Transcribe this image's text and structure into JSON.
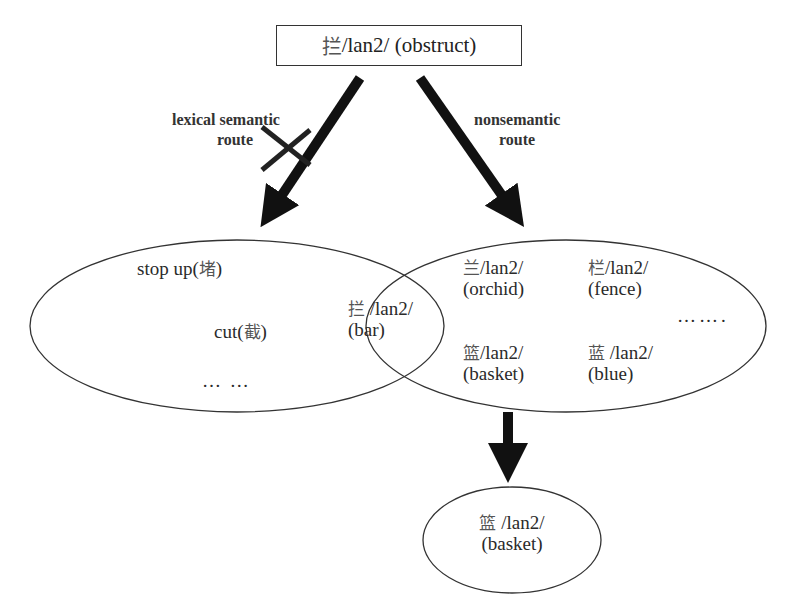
{
  "top_node": {
    "char": "拦",
    "pinyin": "/lan2/",
    "gloss": "(obstruct)"
  },
  "routes": {
    "left": {
      "line1": "lexical semantic",
      "line2": "route",
      "blocked": true
    },
    "right": {
      "line1": "nonsemantic",
      "line2": "route",
      "blocked": false
    }
  },
  "left_set": {
    "items": [
      {
        "text": "stop up(",
        "char": "堵",
        "close": ")"
      },
      {
        "text": "cut(",
        "char": "截",
        "close": ")"
      }
    ],
    "ellipsis": "… …"
  },
  "overlap_item": {
    "char": "拦",
    "pinyin": "/lan2/",
    "gloss": "(bar)"
  },
  "right_set": {
    "items": [
      {
        "char": "兰",
        "pinyin": "/lan2/",
        "gloss": "(orchid)"
      },
      {
        "char": "栏",
        "pinyin": "/lan2/",
        "gloss": "(fence)"
      },
      {
        "char": "篮",
        "pinyin": "/lan2/",
        "gloss": "(basket)"
      },
      {
        "char": "蓝",
        "pinyin": "/lan2/",
        "gloss": "(blue)"
      }
    ],
    "ellipsis": "……."
  },
  "result_node": {
    "char": "篮",
    "pinyin": "/lan2/",
    "gloss": "(basket)"
  },
  "colors": {
    "stroke": "#222222",
    "arrow": "#111111",
    "text": "#2a2a2a",
    "cjk": "#555555"
  }
}
